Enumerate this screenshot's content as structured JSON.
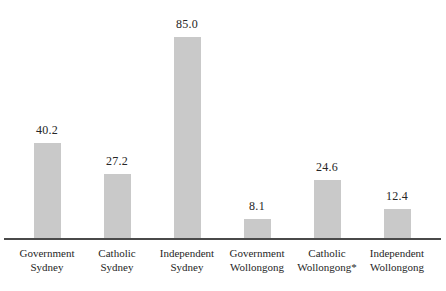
{
  "chart_data": {
    "type": "bar",
    "categories": [
      "Government Sydney",
      "Catholic Sydney",
      "Independent Sydney",
      "Government Wollongong",
      "Catholic Wollongong*",
      "Independent Wollongong"
    ],
    "category_lines": [
      [
        "Government",
        "Sydney"
      ],
      [
        "Catholic",
        "Sydney"
      ],
      [
        "Independent",
        "Sydney"
      ],
      [
        "Government",
        "Wollongong"
      ],
      [
        "Catholic",
        "Wollongong*"
      ],
      [
        "Independent",
        "Wollongong"
      ]
    ],
    "values": [
      40.2,
      27.2,
      85.0,
      8.1,
      24.6,
      12.4
    ],
    "value_labels": [
      "40.2",
      "27.2",
      "85.0",
      "8.1",
      "24.6",
      "12.4"
    ],
    "title": "",
    "xlabel": "",
    "ylabel": "",
    "ylim": [
      0,
      85
    ],
    "grid": false,
    "legend": false,
    "bar_color": "#c9c9c9",
    "axis_color": "#4a4a4a",
    "text_color": "#262626"
  }
}
